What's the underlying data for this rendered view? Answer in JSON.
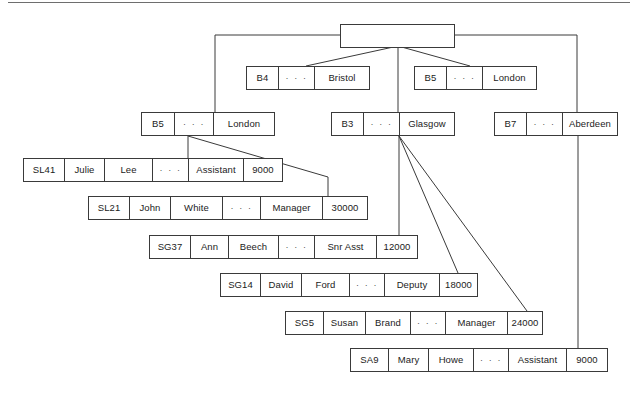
{
  "diagram": {
    "ellipsis": "· · ·",
    "line_color": "#3a3a3a",
    "box_border_color": "#3a3a3a",
    "background": "#ffffff",
    "root": {
      "label": ""
    },
    "branches": [
      {
        "id": "b4-bristol",
        "code": "B4",
        "dots": "· · ·",
        "city": "Bristol"
      },
      {
        "id": "b5-london-a",
        "code": "B5",
        "dots": "· · ·",
        "city": "London"
      },
      {
        "id": "b5-london-b",
        "code": "B5",
        "dots": "· · ·",
        "city": "London"
      },
      {
        "id": "b3-glasgow",
        "code": "B3",
        "dots": "· · ·",
        "city": "Glasgow"
      },
      {
        "id": "b7-aberdeen",
        "code": "B7",
        "dots": "· · ·",
        "city": "Aberdeen"
      }
    ],
    "staff": [
      {
        "id": "sl41",
        "staffno": "SL41",
        "fname": "Julie",
        "lname": "Lee",
        "dots": "· · ·",
        "position": "Assistant",
        "salary": "9000"
      },
      {
        "id": "sl21",
        "staffno": "SL21",
        "fname": "John",
        "lname": "White",
        "dots": "· · ·",
        "position": "Manager",
        "salary": "30000"
      },
      {
        "id": "sg37",
        "staffno": "SG37",
        "fname": "Ann",
        "lname": "Beech",
        "dots": "· · ·",
        "position": "Snr Asst",
        "salary": "12000"
      },
      {
        "id": "sg14",
        "staffno": "SG14",
        "fname": "David",
        "lname": "Ford",
        "dots": "· · ·",
        "position": "Deputy",
        "salary": "18000"
      },
      {
        "id": "sg5",
        "staffno": "SG5",
        "fname": "Susan",
        "lname": "Brand",
        "dots": "· · ·",
        "position": "Manager",
        "salary": "24000"
      },
      {
        "id": "sa9",
        "staffno": "SA9",
        "fname": "Mary",
        "lname": "Howe",
        "dots": "· · ·",
        "position": "Assistant",
        "salary": "9000"
      }
    ]
  }
}
